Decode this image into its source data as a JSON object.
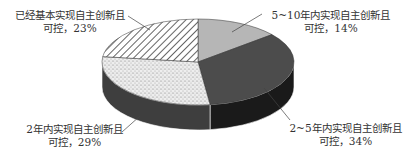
{
  "chart_data": {
    "type": "pie",
    "style": "3d",
    "title": "",
    "categories": [
      "5~10年内实现自主创新且可控",
      "2~5年内实现自主创新且可控",
      "2年内实现自主创新且可控",
      "已经基本实现自主创新且可控"
    ],
    "values": [
      14,
      34,
      29,
      23
    ],
    "unit": "%",
    "labels": [
      {
        "line1": "5~10年内实现自主创新且",
        "line2": "可控，14%"
      },
      {
        "line1": "2~5年内实现自主创新且",
        "line2": "可控，34%"
      },
      {
        "line1": "2年内实现自主创新且",
        "line2": "可控，29%"
      },
      {
        "line1": "已经基本实现自主创新且",
        "line2": "可控，23%"
      }
    ],
    "fills": [
      "light-gray",
      "dark-gray",
      "dotted",
      "diagonal-hatch"
    ],
    "colors": [
      "#b4b4b4",
      "#4a4a4a",
      "#e8e8e8",
      "#ffffff"
    ],
    "legend": "none (callout labels)"
  }
}
